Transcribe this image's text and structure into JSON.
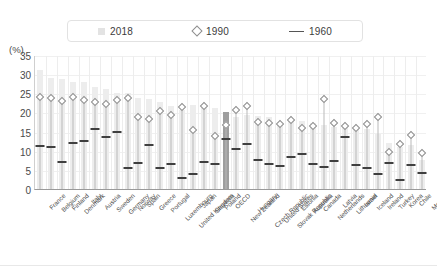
{
  "legend": {
    "items": [
      {
        "label": "2018",
        "marker": "square-swatch-icon",
        "color": "#e3e3e3"
      },
      {
        "label": "1990",
        "marker": "diamond-marker-icon",
        "color": "#8e8e8e"
      },
      {
        "label": "1960",
        "marker": "line-marker-icon",
        "color": "#555555"
      }
    ]
  },
  "axis": {
    "unit_label": "(%)",
    "yticks": [
      "35",
      "30",
      "25",
      "20",
      "15",
      "10",
      "5",
      "0"
    ]
  },
  "chart_data": {
    "type": "bar",
    "title": "",
    "xlabel": "",
    "ylabel": "(%)",
    "ylim": [
      0,
      35
    ],
    "grid": true,
    "legend_position": "top",
    "highlight_category": "OECD",
    "highlight_color": "#9e9e9e",
    "categories": [
      "France",
      "Belgium",
      "Finland",
      "Denmark",
      "Italy",
      "Austria",
      "Sweden",
      "Germany",
      "Norway",
      "Spain",
      "Greece",
      "Portugal",
      "Luxembourg",
      "United Kingdom",
      "Japan",
      "Slovenia",
      "Poland",
      "OECD",
      "New Zealand",
      "Hungary",
      "Czech Republic",
      "United States",
      "Slovak Republic",
      "Estonia",
      "Australia",
      "Canada",
      "Netherlands",
      "Latvia",
      "Lithuania",
      "Israel",
      "Iceland",
      "Ireland",
      "Turkey",
      "Korea",
      "Chile",
      "Mexico"
    ],
    "series": [
      {
        "name": "2018",
        "type": "bar",
        "color": "#ededed",
        "values": [
          31.2,
          28.9,
          28.7,
          28.0,
          27.9,
          26.6,
          26.1,
          25.1,
          25.0,
          23.7,
          23.5,
          22.6,
          21.8,
          20.6,
          21.9,
          21.2,
          21.1,
          20.1,
          18.9,
          19.4,
          19.2,
          18.7,
          17.6,
          18.1,
          17.8,
          17.3,
          16.7,
          16.2,
          16.5,
          16.3,
          15.6,
          14.4,
          12.0,
          11.1,
          11.4,
          7.5
        ]
      },
      {
        "name": "1990",
        "type": "marker-diamond",
        "color": "#8d8d8d",
        "values": [
          25.1,
          24.9,
          24.1,
          25.2,
          24.3,
          23.7,
          23.2,
          24.4,
          24.8,
          19.9,
          19.4,
          21.5,
          20.4,
          22.4,
          16.5,
          22.7,
          14.8,
          17.8,
          21.7,
          22.7,
          18.6,
          18.4,
          18.1,
          19.1,
          17.1,
          17.4,
          24.6,
          18.4,
          17.5,
          17.0,
          18.1,
          19.9,
          10.8,
          12.9,
          15.2,
          10.4
        ]
      },
      {
        "name": "1960",
        "type": "marker-dash",
        "color": "#3f3f3f",
        "values": [
          11.8,
          11.5,
          7.6,
          12.5,
          13.0,
          16.2,
          14.0,
          15.5,
          6.0,
          7.4,
          12.0,
          6.0,
          7.0,
          3.5,
          4.4,
          7.6,
          7.1,
          13.5,
          10.9,
          12.3,
          8.0,
          7.0,
          6.4,
          9.0,
          9.6,
          7.0,
          6.3,
          7.8,
          14.1,
          6.8,
          5.9,
          4.4,
          7.4,
          3.0,
          6.7,
          4.8
        ]
      }
    ]
  }
}
